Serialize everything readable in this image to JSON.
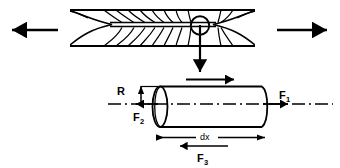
{
  "figure": {
    "background_color": "#ffffff",
    "line_color": "#000000",
    "width": 340,
    "height": 167
  },
  "top_view": {
    "name": "embedded-fiber-in-matrix",
    "description": "Tapered fiber embedded in matrix with curved stress transfer lines",
    "matrix_bounds": {
      "x": 70,
      "y": 8,
      "width": 185,
      "height": 40
    },
    "callout_circle": {
      "cx": 200,
      "cy": 26,
      "r": 9
    },
    "left_load_arrow": {
      "label": "",
      "direction": "left",
      "x_start": 58,
      "x_end": 8,
      "y": 30
    },
    "right_load_arrow": {
      "label": "",
      "direction": "right",
      "x_start": 277,
      "x_end": 331,
      "y": 30
    },
    "callout_arrow": {
      "direction": "down",
      "x": 200,
      "y_start": 36,
      "y_end": 76
    }
  },
  "element_view": {
    "name": "cylindrical-element-free-body",
    "cylinder": {
      "x": 152,
      "y": 86,
      "width": 110,
      "height": 41
    },
    "centerline_style": "dash-dot",
    "forces": [
      {
        "label": "F",
        "subscript": "1",
        "direction": "right",
        "position": {
          "x": 262,
          "y": 104
        },
        "label_x": 281,
        "label_y": 99
      },
      {
        "label": "F",
        "subscript": "2",
        "direction": "left",
        "position": {
          "x": 152,
          "y": 104
        },
        "label_x": 133,
        "label_y": 120
      },
      {
        "label": "F",
        "subscript": "3",
        "direction": "left",
        "position": {
          "x": 203,
          "y": 146
        },
        "label_x": 203,
        "label_y": 160
      }
    ],
    "shear_arrow": {
      "direction": "right",
      "x_start": 186,
      "x_end": 236,
      "y": 80
    },
    "radius_dimension": {
      "label": "R",
      "label_x": 120,
      "label_y": 94,
      "line_x": 141,
      "y_top": 86,
      "y_bottom": 107
    },
    "length_dimension": {
      "label": "dx",
      "label_x": 207,
      "label_y": 136,
      "x_start": 152,
      "x_end": 262,
      "y": 137
    }
  },
  "labels": {
    "f1": "F",
    "f1_sub": "1",
    "f2": "F",
    "f2_sub": "2",
    "f3": "F",
    "f3_sub": "3",
    "radius": "R",
    "length": "dx"
  }
}
